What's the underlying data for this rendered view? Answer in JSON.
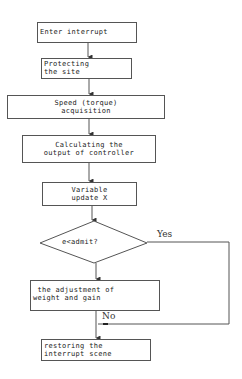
{
  "flowchart": {
    "nodes": [
      {
        "id": "enter",
        "type": "process",
        "text": "Enter interrupt"
      },
      {
        "id": "protect",
        "type": "process",
        "text": "Protecting\nthe site"
      },
      {
        "id": "speed",
        "type": "process",
        "text": "Speed (torque)\nacquisition"
      },
      {
        "id": "calc",
        "type": "process",
        "text": "Calculating the\noutput of controller"
      },
      {
        "id": "update",
        "type": "process",
        "text": "Variable\nupdate X"
      },
      {
        "id": "decision",
        "type": "decision",
        "text": "e<admit?"
      },
      {
        "id": "adjust",
        "type": "process",
        "text": " the adjustment of\nweight and gain"
      },
      {
        "id": "restore",
        "type": "process",
        "text": "restoring the\ninterrupt scene"
      }
    ],
    "edge_labels": {
      "yes": "Yes",
      "no": "No"
    },
    "colors": {
      "line": "#555555",
      "background": "#ffffff"
    }
  }
}
